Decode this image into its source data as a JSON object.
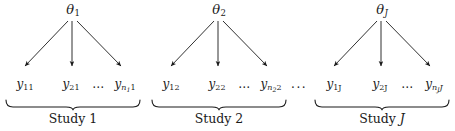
{
  "figure": {
    "type": "hierarchical-model-diagram",
    "background_color": "#ffffff",
    "ink_color": "#1a1a1a",
    "separator_dots": "...",
    "groups": [
      {
        "id": "study-1",
        "theta": {
          "symbol": "θ",
          "subscript": "1",
          "subscript_italic": false
        },
        "leaves": [
          {
            "symbol": "y",
            "subscript": "11",
            "kind": "plain"
          },
          {
            "symbol": "y",
            "subscript": "21",
            "kind": "plain"
          },
          {
            "symbol": "…",
            "kind": "dots"
          },
          {
            "symbol": "y",
            "subscript_base": "n",
            "subscript_sub": "1",
            "subscript_tail": "1",
            "kind": "nested"
          }
        ],
        "caption": {
          "text": "Study",
          "index": "1",
          "index_italic": false
        }
      },
      {
        "id": "study-2",
        "theta": {
          "symbol": "θ",
          "subscript": "2",
          "subscript_italic": false
        },
        "leaves": [
          {
            "symbol": "y",
            "subscript": "12",
            "kind": "plain"
          },
          {
            "symbol": "y",
            "subscript": "22",
            "kind": "plain"
          },
          {
            "symbol": "…",
            "kind": "dots"
          },
          {
            "symbol": "y",
            "subscript_base": "n",
            "subscript_sub": "2",
            "subscript_tail": "2",
            "kind": "nested"
          }
        ],
        "caption": {
          "text": "Study",
          "index": "2",
          "index_italic": false
        }
      },
      {
        "id": "study-J",
        "theta": {
          "symbol": "θ",
          "subscript": "J",
          "subscript_italic": true
        },
        "leaves": [
          {
            "symbol": "y",
            "subscript": "1J",
            "kind": "plain-italic-tail"
          },
          {
            "symbol": "y",
            "subscript": "2J",
            "kind": "plain-italic-tail"
          },
          {
            "symbol": "…",
            "kind": "dots"
          },
          {
            "symbol": "y",
            "subscript_base": "n",
            "subscript_sub": "J",
            "subscript_tail": "J",
            "kind": "nested"
          }
        ],
        "caption": {
          "text": "Study",
          "index": "J",
          "index_italic": true
        }
      }
    ]
  }
}
